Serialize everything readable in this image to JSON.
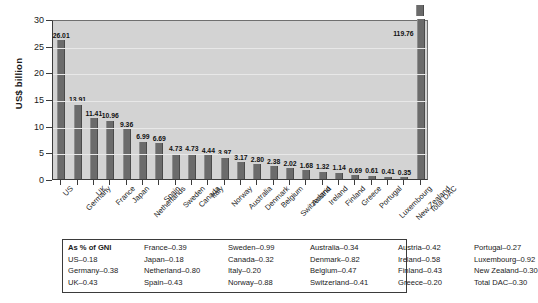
{
  "chart_data": {
    "type": "bar",
    "title": "",
    "xlabel": "",
    "ylabel": "US$ billion",
    "ylim": [
      0,
      30
    ],
    "ytick_step": 5,
    "yticks": [
      "0",
      "5",
      "10",
      "15",
      "20",
      "25",
      "30"
    ],
    "grid": true,
    "legend": "none",
    "axis_break_note": "Total DAC bar (119.76) exceeds the 30 axis maximum and is drawn broken at the top of the plot.",
    "categories": [
      "US",
      "Germany",
      "UK",
      "France",
      "Japan",
      "Netherlands",
      "Spain",
      "Sweden",
      "Canada",
      "Italy",
      "Norway",
      "Australia",
      "Denmark",
      "Belgium",
      "Switzerland",
      "Austria",
      "Ireland",
      "Finland",
      "Greece",
      "Portugal",
      "Luxembourg",
      "New Zealand",
      "Total DAC"
    ],
    "values": [
      26.01,
      13.91,
      11.41,
      10.96,
      9.36,
      6.99,
      6.69,
      4.73,
      4.73,
      4.44,
      3.97,
      3.17,
      2.8,
      2.38,
      2.02,
      1.68,
      1.32,
      1.14,
      0.69,
      0.61,
      0.41,
      0.35,
      119.76
    ],
    "value_labels": [
      "26.01",
      "13.91",
      "11.41",
      "10.96",
      "9.36",
      "6.99",
      "6.69",
      "4.73",
      "4.73",
      "4.44",
      "3.97",
      "3.17",
      "2.80",
      "2.38",
      "2.02",
      "1.68",
      "1.32",
      "1.14",
      "0.69",
      "0.61",
      "0.41",
      "0.35",
      "119.76"
    ],
    "bar_color": "#6b6b6b",
    "plot_background": "#d3d3d3"
  },
  "legend_table": {
    "header": "As % of GNI",
    "entries": [
      "US–0.18",
      "Germany–0.38",
      "UK–0.43",
      "France–0.39",
      "Japan–0.18",
      "Netherland–0.80",
      "Spain–0.43",
      "Sweden–0.99",
      "Canada–0.32",
      "Italy–0.20",
      "Norway–0.88",
      "Australia–0.34",
      "Denmark–0.82",
      "Belgium–0.47",
      "Switzerland–0.41",
      "Austria–0.42",
      "Ireland–0.58",
      "Finland–0.43",
      "Greece–0.20",
      "Portugal–0.27",
      "Luxembourg–0.92",
      "New Zealand–0.30",
      "Total DAC–0.30"
    ],
    "columns": [
      [
        "As % of GNI",
        "US–0.18",
        "Germany–0.38",
        "UK–0.43"
      ],
      [
        "France–0.39",
        "Japan–0.18",
        "Netherland–0.80",
        "Spain–0.43"
      ],
      [
        "Sweden–0.99",
        "Canada–0.32",
        "Italy–0.20",
        "Norway–0.88"
      ],
      [
        "Australia–0.34",
        "Denmark–0.82",
        "Belgium–0.47",
        "Switzerland–0.41"
      ],
      [
        "Austria–0.42",
        "Ireland–0.58",
        "Finland–0.43",
        "Greece–0.20"
      ],
      [
        "Portugal–0.27",
        "Luxembourg–0.92",
        "New Zealand–0.30",
        "Total DAC–0.30"
      ]
    ]
  }
}
